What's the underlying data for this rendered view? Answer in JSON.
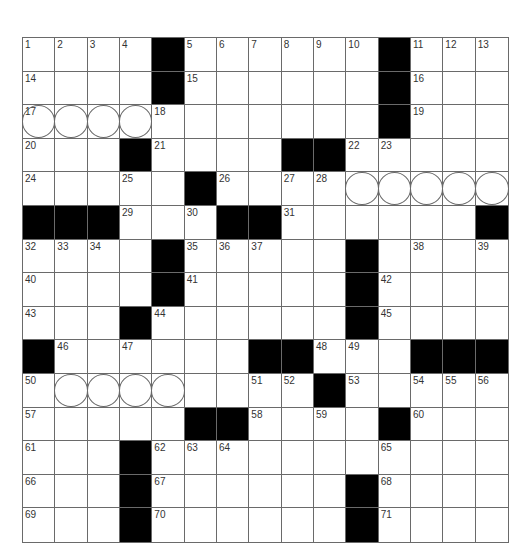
{
  "puzzle": {
    "size": {
      "rows": 15,
      "cols": 15
    },
    "colors": {
      "block": "#000000",
      "cell": "#ffffff",
      "line": "#6a6a6a",
      "number": "#333333"
    },
    "layout": [
      "....#......#...",
      "....#......#...",
      "...........#...",
      "...#....##.....",
      ".....#.........",
      "###...##......#",
      "....#.....#....",
      "....#.....#....",
      "...#......#....",
      "#......##...###",
      ".........#.....",
      ".....##....#...",
      "...#...........",
      "...#......#....",
      "...#......#...."
    ],
    "numbers": [
      [
        1,
        2,
        3,
        4,
        null,
        5,
        6,
        7,
        8,
        9,
        10,
        null,
        11,
        12,
        13
      ],
      [
        14,
        null,
        null,
        null,
        null,
        15,
        null,
        null,
        null,
        null,
        null,
        null,
        16,
        null,
        null
      ],
      [
        17,
        null,
        null,
        null,
        18,
        null,
        null,
        null,
        null,
        null,
        null,
        null,
        19,
        null,
        null
      ],
      [
        20,
        null,
        null,
        null,
        21,
        null,
        null,
        null,
        null,
        null,
        22,
        23,
        null,
        null,
        null
      ],
      [
        24,
        null,
        null,
        25,
        null,
        null,
        26,
        null,
        27,
        28,
        null,
        null,
        null,
        null,
        null
      ],
      [
        null,
        null,
        null,
        29,
        null,
        30,
        null,
        null,
        31,
        null,
        null,
        null,
        null,
        null,
        null
      ],
      [
        32,
        33,
        34,
        null,
        null,
        35,
        36,
        37,
        null,
        null,
        null,
        null,
        38,
        null,
        39
      ],
      [
        40,
        null,
        null,
        null,
        null,
        41,
        null,
        null,
        null,
        null,
        null,
        42,
        null,
        null,
        null
      ],
      [
        43,
        null,
        null,
        null,
        44,
        null,
        null,
        null,
        null,
        null,
        null,
        45,
        null,
        null,
        null
      ],
      [
        null,
        46,
        null,
        47,
        null,
        null,
        null,
        null,
        null,
        48,
        49,
        null,
        null,
        null,
        null
      ],
      [
        50,
        null,
        null,
        null,
        null,
        null,
        null,
        51,
        52,
        null,
        53,
        null,
        54,
        55,
        56
      ],
      [
        57,
        null,
        null,
        null,
        null,
        null,
        null,
        58,
        null,
        59,
        null,
        null,
        60,
        null,
        null
      ],
      [
        61,
        null,
        null,
        null,
        62,
        63,
        64,
        null,
        null,
        null,
        null,
        65,
        null,
        null,
        null
      ],
      [
        66,
        null,
        null,
        null,
        67,
        null,
        null,
        null,
        null,
        null,
        null,
        68,
        null,
        null,
        null
      ],
      [
        69,
        null,
        null,
        null,
        70,
        null,
        null,
        null,
        null,
        null,
        null,
        71,
        null,
        null,
        null
      ]
    ],
    "circled_cells": [
      [
        2,
        0
      ],
      [
        2,
        1
      ],
      [
        2,
        2
      ],
      [
        2,
        3
      ],
      [
        4,
        10
      ],
      [
        4,
        11
      ],
      [
        4,
        12
      ],
      [
        4,
        13
      ],
      [
        4,
        14
      ],
      [
        10,
        1
      ],
      [
        10,
        2
      ],
      [
        10,
        3
      ],
      [
        10,
        4
      ]
    ],
    "entries": {}
  }
}
